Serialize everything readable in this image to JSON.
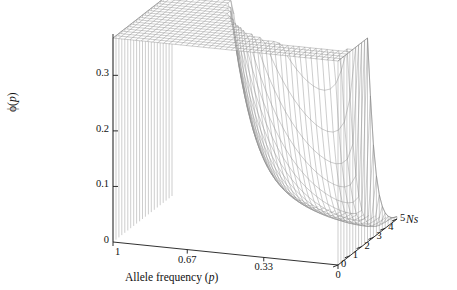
{
  "figure": {
    "type": "3d-surface-wireframe",
    "background": "#ffffff",
    "mesh_color": "#8a8a8a",
    "axis_color": "#1a1a1a"
  },
  "axes": {
    "x": {
      "title_plain": "Allele frequency (",
      "title_italic": "p",
      "title_close": ")",
      "ticks": [
        "1",
        "0.67",
        "0.33",
        "0"
      ],
      "tick_values": [
        1,
        0.67,
        0.33,
        0
      ],
      "range": [
        1,
        0
      ]
    },
    "y": {
      "title_symbol": "ϕ",
      "title_open": "(",
      "title_italic": "p",
      "title_close": ")",
      "ticks": [
        "0",
        "0.1",
        "0.2",
        "0.3"
      ],
      "tick_values": [
        0,
        0.1,
        0.2,
        0.3
      ],
      "range": [
        0,
        0.36
      ]
    },
    "z": {
      "title_italic_n": "N",
      "title_italic_s": "s",
      "ticks": [
        "0",
        "1",
        "2",
        "3",
        "4",
        "5"
      ],
      "tick_values": [
        0,
        1,
        2,
        3,
        4,
        5
      ],
      "range": [
        0,
        5
      ]
    }
  },
  "chart_data": {
    "type": "surface",
    "title": "",
    "xlabel": "Allele frequency (p)",
    "ylabel": "ϕ(p)",
    "zlabel": "Ns",
    "xlim": [
      0,
      1
    ],
    "ylim": [
      0,
      0.36
    ],
    "zlim": [
      0,
      5
    ],
    "grid": false,
    "legend": "none",
    "x_axis_direction": "p decreases left to right (1 at left, 0 at right)",
    "x": [
      0.0,
      0.025,
      0.05,
      0.075,
      0.1,
      0.125,
      0.15,
      0.175,
      0.2,
      0.225,
      0.25,
      0.275,
      0.3,
      0.325,
      0.35,
      0.375,
      0.4,
      0.425,
      0.45,
      0.475,
      0.5,
      0.525,
      0.55,
      0.575,
      0.6,
      0.625,
      0.65,
      0.675,
      0.7,
      0.725,
      0.75,
      0.775,
      0.8,
      0.825,
      0.85,
      0.875,
      0.9,
      0.925,
      0.95,
      0.975,
      1.0
    ],
    "z": [
      0.0,
      0.25,
      0.5,
      0.75,
      1.0,
      1.25,
      1.5,
      1.75,
      2.0,
      2.25,
      2.5,
      2.75,
      3.0,
      3.25,
      3.5,
      3.75,
      4.0,
      4.25,
      4.5,
      4.75,
      5.0
    ],
    "surface_model": {
      "name": "wright-distribution",
      "formula": "phi(p, Ns) = C * exp(2*Ns*p) * p^(a-1) * (1-p)^(b-1)",
      "theta_a": 0.62,
      "theta_b": 0.62,
      "normalized": true,
      "description": "Allele frequency distribution under selection; U-shaped at Ns=0 rising to a strong peak near p=1 (plotted leftwards) as Ns increases to 5. Mesh walls at p=0 and p=1 boundaries rise to finite edge values."
    },
    "key_values": {
      "peak_phi": 0.36,
      "peak_at_Ns": 5,
      "edge_phi_p1_Ns0": 0.105,
      "edge_phi_p1_Ns5": 0.245,
      "edge_phi_p0_Ns0": 0.105,
      "edge_phi_p0_Ns5": 0.2,
      "min_interior_phi": 0.02
    }
  }
}
